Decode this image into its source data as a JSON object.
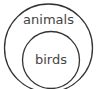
{
  "diagram": {
    "type": "euler",
    "sets": [
      {
        "label": "animals",
        "contains": [
          "birds"
        ]
      },
      {
        "label": "birds"
      }
    ],
    "stroke_color": "#333333"
  }
}
